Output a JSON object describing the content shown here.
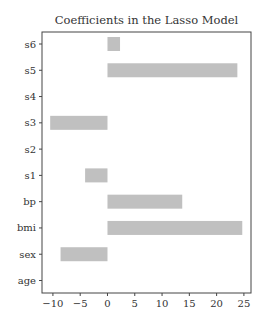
{
  "chart_data": {
    "type": "bar",
    "orientation": "horizontal",
    "title": "Coefficients in the Lasso Model",
    "xlabel": "",
    "ylabel": "",
    "categories": [
      "age",
      "sex",
      "bmi",
      "bp",
      "s1",
      "s2",
      "s3",
      "s4",
      "s5",
      "s6"
    ],
    "values": [
      0.0,
      -8.6,
      24.7,
      13.7,
      -4.1,
      0.0,
      -10.5,
      0.0,
      23.8,
      2.3
    ],
    "xlim": [
      -12,
      26.3
    ],
    "xticks": [
      -10,
      -5,
      0,
      5,
      10,
      15,
      20,
      25
    ],
    "grid": false,
    "bar_color": "#c0c0c0",
    "axis_color": "#444444"
  }
}
